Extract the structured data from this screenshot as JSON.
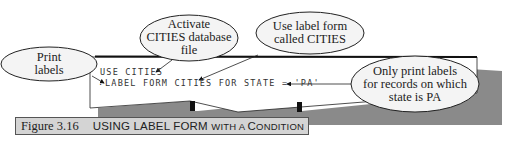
{
  "screen": {
    "lines": [
      "USE CITIES",
      "LABEL FORM CITIES FOR STATE = 'PA'"
    ],
    "prompt": "."
  },
  "callouts": [
    {
      "id": "print-labels",
      "lines": [
        "Print",
        "labels"
      ]
    },
    {
      "id": "activate-cities",
      "lines": [
        "Activate",
        "CITIES database",
        "file"
      ]
    },
    {
      "id": "use-label-form",
      "lines": [
        "Use label form",
        "called CITIES"
      ]
    },
    {
      "id": "only-print",
      "lines": [
        "Only print labels",
        "for records on which",
        "state is PA"
      ]
    }
  ],
  "caption": {
    "number": "Figure 3.16",
    "title_parts": [
      {
        "text": "USING LABEL FORM ",
        "small": false
      },
      {
        "text": "WITH A ",
        "small": true
      },
      {
        "text": "C",
        "small": false
      },
      {
        "text": "ONDITION",
        "small": true
      }
    ],
    "title": "USING LABEL FORM WITH A CONDITION"
  },
  "colors": {
    "shadow": "#8a8a8a",
    "caption_bg": "#d4d4d4",
    "line": "#222222",
    "bubble_fill": "#f4f4f4"
  }
}
